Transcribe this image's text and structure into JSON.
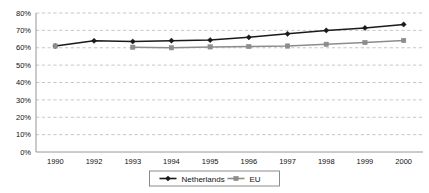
{
  "chart_data": {
    "type": "line",
    "title": "",
    "subtitle": "",
    "xlabel": "",
    "ylabel": "",
    "ylim": [
      0,
      80
    ],
    "ytick_values": [
      0,
      10,
      20,
      30,
      40,
      50,
      60,
      70,
      80
    ],
    "ytick_labels": [
      "0%",
      "10%",
      "20%",
      "30%",
      "40%",
      "50%",
      "60%",
      "70%",
      "80%"
    ],
    "categories": [
      "1990",
      "1992",
      "1993",
      "1994",
      "1995",
      "1996",
      "1997",
      "1998",
      "1999",
      "2000"
    ],
    "grid": "horizontal-dashed",
    "legend_position": "bottom-center",
    "series": [
      {
        "name": "Netherlands",
        "color": "#1a1a1a",
        "marker": "diamond",
        "values": [
          61.0,
          64.0,
          63.6,
          64.1,
          64.4,
          66.0,
          68.0,
          70.0,
          71.4,
          73.4
        ]
      },
      {
        "name": "EU",
        "color": "#8c8c8c",
        "marker": "square",
        "values": [
          61.0,
          null,
          60.3,
          60.0,
          60.5,
          60.7,
          61.0,
          62.0,
          63.0,
          64.2
        ]
      }
    ]
  },
  "legend": {
    "items": [
      {
        "label": "Netherlands",
        "color": "#1a1a1a"
      },
      {
        "label": "EU",
        "color": "#8c8c8c"
      }
    ]
  },
  "colors": {
    "netherlands": "#1a1a1a",
    "eu": "#8c8c8c",
    "grid": "#b9b9b9",
    "axis": "#8a8a8a",
    "background": "#ffffff"
  }
}
